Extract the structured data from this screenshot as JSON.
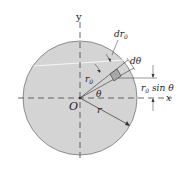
{
  "diagram": {
    "type": "polar-area-element",
    "colors": {
      "disk_fill": "#d4d4d4",
      "disk_stroke": "#777777",
      "element_fill": "#a8a8a8",
      "line": "#333333",
      "axis": "#444444"
    },
    "labels": {
      "y_axis": "y",
      "x_axis": "x",
      "origin": "O",
      "radius": "r",
      "r0": "r",
      "r0_sub": "0",
      "dr0_d": "dr",
      "dr0_sub": "0",
      "dtheta": "dθ",
      "theta": "θ",
      "r0sin_r": "r",
      "r0sin_sub": "0",
      "r0sin_rest": " sin θ"
    }
  }
}
